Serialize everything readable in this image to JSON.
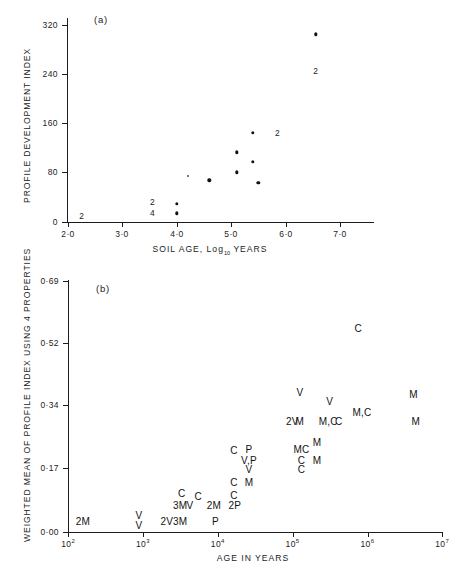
{
  "figure": {
    "background": "#ffffff",
    "ink": "#1c1c1c"
  },
  "panel_a": {
    "tag": "(a)",
    "xlabel_pre": "SOIL AGE, Log",
    "xlabel_sub": "10",
    "xlabel_post": " YEARS",
    "ylabel": "PROFILE DEVELOPMENT INDEX",
    "xticks": [
      "2·0",
      "3·0",
      "4·0",
      "5·0",
      "6·0",
      "7·0"
    ],
    "yticks": [
      "320",
      "240",
      "160",
      "80",
      "0"
    ]
  },
  "panel_b": {
    "tag": "(b)",
    "xlabel": "AGE IN YEARS",
    "ylabel": "WEIGHTED MEAN OF PROFILE INDEX USING 4 PROPERTIES",
    "xticks": [
      "2",
      "3",
      "4",
      "5",
      "6",
      "7"
    ],
    "xtick_base": "10",
    "yticks": [
      "0·69",
      "0·52",
      "0·34",
      "0·17",
      "0·00"
    ]
  },
  "chart_data": [
    {
      "type": "scatter",
      "panel": "(a)",
      "title": "Profile development index versus soil age",
      "xlabel": "SOIL AGE, Log10 YEARS",
      "ylabel": "PROFILE DEVELOPMENT INDEX",
      "xlim": [
        2.0,
        7.6
      ],
      "ylim": [
        0,
        340
      ],
      "xticks": [
        2.0,
        3.0,
        4.0,
        5.0,
        6.0,
        7.0
      ],
      "yticks": [
        0,
        80,
        160,
        240,
        320
      ],
      "grid": false,
      "legend": "none",
      "points": [
        {
          "x": 4.0,
          "y": 30,
          "marker": "dot"
        },
        {
          "x": 4.0,
          "y": 14,
          "marker": "dot"
        },
        {
          "x": 4.2,
          "y": 75,
          "marker": "dot-small"
        },
        {
          "x": 4.6,
          "y": 68,
          "marker": "dot"
        },
        {
          "x": 5.1,
          "y": 81,
          "marker": "dot"
        },
        {
          "x": 5.1,
          "y": 113,
          "marker": "dot"
        },
        {
          "x": 5.4,
          "y": 145,
          "marker": "dot"
        },
        {
          "x": 5.4,
          "y": 98,
          "marker": "dot"
        },
        {
          "x": 5.5,
          "y": 64,
          "marker": "dot"
        },
        {
          "x": 6.55,
          "y": 305,
          "marker": "dot"
        }
      ],
      "count_annotations": [
        {
          "x": 2.25,
          "y": 10,
          "text": "2"
        },
        {
          "x": 3.55,
          "y": 32,
          "text": "2"
        },
        {
          "x": 3.55,
          "y": 14,
          "text": "4"
        },
        {
          "x": 5.85,
          "y": 145,
          "text": "2"
        },
        {
          "x": 6.55,
          "y": 245,
          "text": "2"
        }
      ]
    },
    {
      "type": "scatter",
      "panel": "(b)",
      "title": "Weighted mean of profile index using 4 properties versus age",
      "xlabel": "AGE IN YEARS",
      "ylabel": "WEIGHTED MEAN OF PROFILE INDEX USING 4 PROPERTIES",
      "xscale": "log10",
      "xlim": [
        100,
        10000000
      ],
      "ylim": [
        0.0,
        0.69
      ],
      "xticks": [
        100,
        1000,
        10000,
        100000,
        1000000,
        10000000
      ],
      "yticks": [
        0.0,
        0.17,
        0.34,
        0.52,
        0.69
      ],
      "grid": false,
      "legend": "none",
      "labeled_points": [
        {
          "log_x": 2.2,
          "y": 0.03,
          "label": "2M"
        },
        {
          "log_x": 2.95,
          "y": 0.047,
          "label": "V"
        },
        {
          "log_x": 2.95,
          "y": 0.02,
          "label": "V"
        },
        {
          "log_x": 3.32,
          "y": 0.03,
          "label": "2V"
        },
        {
          "log_x": 3.5,
          "y": 0.073,
          "label": "3M"
        },
        {
          "log_x": 3.5,
          "y": 0.03,
          "label": "3M"
        },
        {
          "log_x": 3.52,
          "y": 0.108,
          "label": "C"
        },
        {
          "log_x": 3.63,
          "y": 0.073,
          "label": "V"
        },
        {
          "log_x": 3.74,
          "y": 0.098,
          "label": "C"
        },
        {
          "log_x": 3.95,
          "y": 0.073,
          "label": "2M"
        },
        {
          "log_x": 3.97,
          "y": 0.03,
          "label": "P"
        },
        {
          "log_x": 4.23,
          "y": 0.073,
          "label": "2P"
        },
        {
          "log_x": 4.22,
          "y": 0.103,
          "label": "C"
        },
        {
          "log_x": 4.22,
          "y": 0.137,
          "label": "C"
        },
        {
          "log_x": 4.22,
          "y": 0.225,
          "label": "C"
        },
        {
          "log_x": 4.42,
          "y": 0.137,
          "label": "M"
        },
        {
          "log_x": 4.42,
          "y": 0.172,
          "label": "V"
        },
        {
          "log_x": 4.42,
          "y": 0.198,
          "label": "V,P"
        },
        {
          "log_x": 4.42,
          "y": 0.228,
          "label": "P"
        },
        {
          "log_x": 5.0,
          "y": 0.305,
          "label": "2V"
        },
        {
          "log_x": 5.1,
          "y": 0.305,
          "label": "M"
        },
        {
          "log_x": 5.1,
          "y": 0.385,
          "label": "V"
        },
        {
          "log_x": 5.12,
          "y": 0.172,
          "label": "C"
        },
        {
          "log_x": 5.12,
          "y": 0.198,
          "label": "C"
        },
        {
          "log_x": 5.12,
          "y": 0.228,
          "label": "MC"
        },
        {
          "log_x": 5.33,
          "y": 0.198,
          "label": "M"
        },
        {
          "log_x": 5.33,
          "y": 0.248,
          "label": "M"
        },
        {
          "log_x": 5.48,
          "y": 0.305,
          "label": "M,C"
        },
        {
          "log_x": 5.5,
          "y": 0.36,
          "label": "V"
        },
        {
          "log_x": 5.62,
          "y": 0.305,
          "label": "C"
        },
        {
          "log_x": 5.93,
          "y": 0.33,
          "label": "M,C"
        },
        {
          "log_x": 5.88,
          "y": 0.56,
          "label": "C"
        },
        {
          "log_x": 6.65,
          "y": 0.305,
          "label": "M"
        },
        {
          "log_x": 6.62,
          "y": 0.38,
          "label": "M"
        }
      ]
    }
  ]
}
